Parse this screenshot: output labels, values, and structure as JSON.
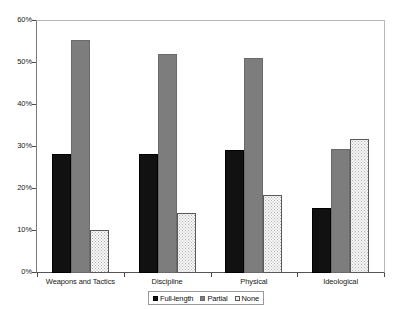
{
  "chart_data": {
    "type": "bar",
    "title": "",
    "subtitle": "",
    "xlabel": "",
    "ylabel": "",
    "categories": [
      "Weapons and Tactics",
      "Discipline",
      "Physical",
      "Ideological"
    ],
    "series": [
      {
        "name": "Full-length",
        "values": [
          28.3,
          28.3,
          29.2,
          15.4
        ],
        "color": "#111111",
        "fill": "solid-black"
      },
      {
        "name": "Partial",
        "values": [
          55.4,
          52.2,
          51.3,
          29.6
        ],
        "color": "#7d7d7d",
        "fill": "solid-gray"
      },
      {
        "name": "None",
        "values": [
          10.2,
          14.2,
          18.6,
          31.8
        ],
        "color": "#f7f7f7",
        "fill": "dotted-stipple"
      }
    ],
    "ylim": [
      0,
      60
    ],
    "ytick_values": [
      0,
      10,
      20,
      30,
      40,
      50,
      60
    ],
    "ytick_labels": [
      "0%",
      "10%",
      "20%",
      "30%",
      "40%",
      "50%",
      "60%"
    ],
    "grid": false,
    "legend_position": "bottom-center",
    "legend_entries": [
      "Full-length",
      "Partial",
      "None"
    ],
    "annotations": []
  }
}
